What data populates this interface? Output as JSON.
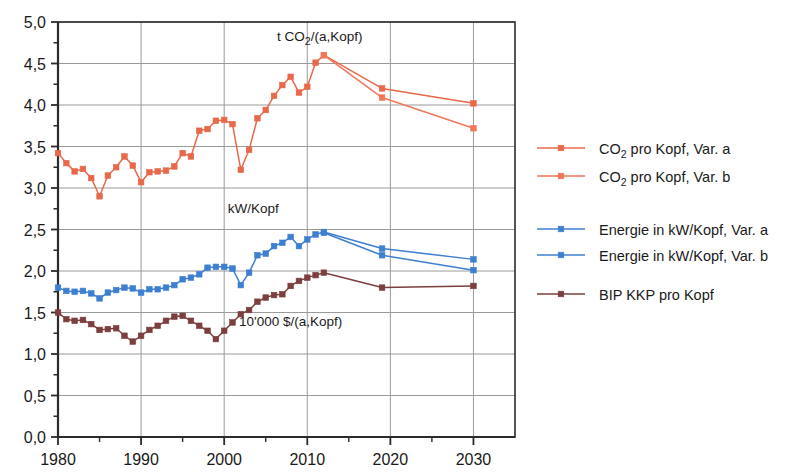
{
  "chart_data": {
    "type": "line",
    "title": "",
    "xlabel": "",
    "ylabel": "",
    "xlim": [
      1980,
      2035
    ],
    "ylim": [
      0.0,
      5.0
    ],
    "grid": true,
    "legend_position": "right",
    "x_ticks": [
      "1980",
      "1990",
      "2000",
      "2010",
      "2020",
      "2030"
    ],
    "x_tick_values": [
      1980,
      1990,
      2000,
      2010,
      2020,
      2030
    ],
    "y_ticks": [
      "0,0",
      "0,5",
      "1,0",
      "1,5",
      "2,0",
      "2,5",
      "3,0",
      "3,5",
      "4,0",
      "4,5",
      "5,0"
    ],
    "y_tick_values": [
      0.0,
      0.5,
      1.0,
      1.5,
      2.0,
      2.5,
      3.0,
      3.5,
      4.0,
      4.5,
      5.0
    ],
    "y_minor_step": 0.25,
    "x_minor_step": 5,
    "annotations": [
      {
        "text": "t CO",
        "sub": "2",
        "text2": "/(a,Kopf)",
        "x": 2011.5,
        "y": 4.77
      },
      {
        "text": "kW/Kopf",
        "sub": "",
        "text2": "",
        "x": 2003.5,
        "y": 2.7
      },
      {
        "text": "10'000 $/(a,Kopf)",
        "sub": "",
        "text2": "",
        "x": 2008.0,
        "y": 1.34
      }
    ],
    "series": [
      {
        "name": "CO2 pro Kopf, Var. a",
        "color": "#e8684a",
        "marker": "square",
        "x": [
          1980,
          1981,
          1982,
          1983,
          1984,
          1985,
          1986,
          1987,
          1988,
          1989,
          1990,
          1991,
          1992,
          1993,
          1994,
          1995,
          1996,
          1997,
          1998,
          1999,
          2000,
          2001,
          2002,
          2003,
          2004,
          2005,
          2006,
          2007,
          2008,
          2009,
          2010,
          2011,
          2012,
          2019,
          2030
        ],
        "values": [
          3.42,
          3.3,
          3.2,
          3.23,
          3.12,
          2.9,
          3.15,
          3.25,
          3.38,
          3.27,
          3.07,
          3.19,
          3.2,
          3.21,
          3.26,
          3.42,
          3.38,
          3.69,
          3.71,
          3.81,
          3.82,
          3.77,
          3.22,
          3.46,
          3.84,
          3.94,
          4.11,
          4.24,
          4.34,
          4.15,
          4.22,
          4.51,
          4.6,
          4.2,
          4.02
        ]
      },
      {
        "name": "CO2 pro Kopf, Var. b",
        "color": "#f2765a",
        "marker": "square",
        "x": [
          2012,
          2019,
          2030
        ],
        "values": [
          4.6,
          4.09,
          3.72
        ]
      },
      {
        "name": "Energie in kW/Kopf, Var. a",
        "color": "#3f7fd0",
        "marker": "square",
        "x": [
          1980,
          1981,
          1982,
          1983,
          1984,
          1985,
          1986,
          1987,
          1988,
          1989,
          1990,
          1991,
          1992,
          1993,
          1994,
          1995,
          1996,
          1997,
          1998,
          1999,
          2000,
          2001,
          2002,
          2003,
          2004,
          2005,
          2006,
          2007,
          2008,
          2009,
          2010,
          2011,
          2012,
          2019,
          2030
        ],
        "values": [
          1.8,
          1.76,
          1.75,
          1.76,
          1.73,
          1.67,
          1.74,
          1.77,
          1.8,
          1.79,
          1.74,
          1.78,
          1.78,
          1.8,
          1.83,
          1.9,
          1.92,
          1.96,
          2.04,
          2.05,
          2.05,
          2.03,
          1.83,
          1.98,
          2.19,
          2.21,
          2.3,
          2.34,
          2.41,
          2.3,
          2.38,
          2.44,
          2.47,
          2.27,
          2.14
        ],
        "values_note": ""
      },
      {
        "name": "Energie in kW/Kopf, Var. b",
        "color": "#3f7fd0",
        "marker": "square",
        "x": [
          2012,
          2019,
          2030
        ],
        "values": [
          2.46,
          2.19,
          2.01
        ]
      },
      {
        "name": "BIP KKP pro Kopf",
        "color": "#7b3f3f",
        "marker": "square",
        "x": [
          1980,
          1981,
          1982,
          1983,
          1984,
          1985,
          1986,
          1987,
          1988,
          1989,
          1990,
          1991,
          1992,
          1993,
          1994,
          1995,
          1996,
          1997,
          1998,
          1999,
          2000,
          2001,
          2002,
          2003,
          2004,
          2005,
          2006,
          2007,
          2008,
          2009,
          2010,
          2011,
          2012,
          2019,
          2030
        ],
        "values": [
          1.5,
          1.42,
          1.4,
          1.41,
          1.36,
          1.29,
          1.3,
          1.31,
          1.22,
          1.15,
          1.22,
          1.29,
          1.34,
          1.4,
          1.45,
          1.46,
          1.4,
          1.34,
          1.28,
          1.18,
          1.28,
          1.38,
          1.48,
          1.53,
          1.63,
          1.68,
          1.71,
          1.72,
          1.82,
          1.88,
          1.92,
          1.95,
          1.98,
          1.8,
          1.82
        ]
      }
    ]
  },
  "legend": {
    "entries": [
      {
        "label_pre": "CO",
        "label_sub": "2",
        "label_post": " pro Kopf, Var. a",
        "color": "#e8684a",
        "group": 1
      },
      {
        "label_pre": "CO",
        "label_sub": "2",
        "label_post": " pro Kopf, Var. b",
        "color": "#f2765a",
        "group": 1
      },
      {
        "label_pre": "Energie in kW/Kopf, Var. a",
        "label_sub": "",
        "label_post": "",
        "color": "#3f7fd0",
        "group": 2
      },
      {
        "label_pre": "Energie in kW/Kopf, Var. b",
        "label_sub": "",
        "label_post": "",
        "color": "#3f7fd0",
        "group": 2
      },
      {
        "label_pre": "BIP KKP pro Kopf",
        "label_sub": "",
        "label_post": "",
        "color": "#7b3f3f",
        "group": 3
      }
    ]
  },
  "axes": {
    "frame_color": "#2b2b2b",
    "grid_color": "#9a9a9a"
  }
}
